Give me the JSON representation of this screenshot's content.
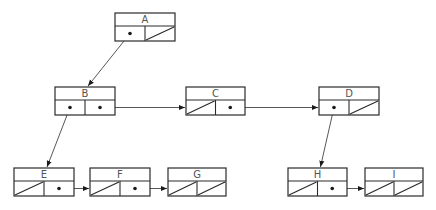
{
  "diagram": {
    "title": "",
    "nodes": [
      {
        "id": "A",
        "label": "A",
        "x": 115,
        "y": 13,
        "w": 60,
        "left": "pointer",
        "right": "null"
      },
      {
        "id": "B",
        "label": "B",
        "x": 55,
        "y": 87,
        "w": 60,
        "left": "pointer",
        "right": "pointer"
      },
      {
        "id": "C",
        "label": "C",
        "x": 186,
        "y": 87,
        "w": 59,
        "left": "null",
        "right": "pointer"
      },
      {
        "id": "D",
        "label": "D",
        "x": 319,
        "y": 87,
        "w": 60,
        "left": "pointer",
        "right": "null"
      },
      {
        "id": "E",
        "label": "E",
        "x": 14,
        "y": 168,
        "w": 60,
        "left": "null",
        "right": "pointer"
      },
      {
        "id": "F",
        "label": "F",
        "x": 90,
        "y": 168,
        "w": 60,
        "left": "null",
        "right": "pointer"
      },
      {
        "id": "G",
        "label": "G",
        "x": 168,
        "y": 168,
        "w": 58,
        "left": "null",
        "right": "null"
      },
      {
        "id": "H",
        "label": "H",
        "x": 288,
        "y": 168,
        "w": 59,
        "left": "null",
        "right": "pointer"
      },
      {
        "id": "I",
        "label": "I",
        "x": 365,
        "y": 168,
        "w": 58,
        "left": "null",
        "right": "null"
      }
    ],
    "edges": [
      {
        "from": "A",
        "to": "B",
        "kind": "first-child"
      },
      {
        "from": "B",
        "to": "E",
        "kind": "first-child"
      },
      {
        "from": "B",
        "to": "C",
        "kind": "next-sibling"
      },
      {
        "from": "C",
        "to": "D",
        "kind": "next-sibling"
      },
      {
        "from": "D",
        "to": "H",
        "kind": "first-child"
      },
      {
        "from": "E",
        "to": "F",
        "kind": "next-sibling"
      },
      {
        "from": "F",
        "to": "G",
        "kind": "next-sibling"
      },
      {
        "from": "H",
        "to": "I",
        "kind": "next-sibling"
      }
    ],
    "colors": {
      "stroke": "#2b2b2b",
      "label": "#555555",
      "background": "#ffffff"
    }
  }
}
